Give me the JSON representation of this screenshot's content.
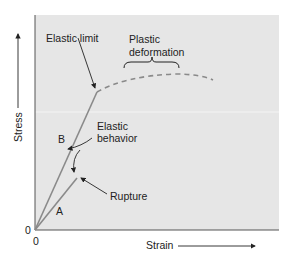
{
  "diagram": {
    "axes": {
      "y_label": "Stress",
      "x_label": "Strain",
      "y_origin_label": "0",
      "x_origin_label": "0"
    },
    "annotations": {
      "elastic_limit": "Elastic limit",
      "plastic_line1": "Plastic",
      "plastic_line2": "deformation",
      "elastic_line1": "Elastic",
      "elastic_line2": "behavior",
      "rupture": "Rupture",
      "curve_a": "A",
      "curve_b": "B"
    },
    "colors": {
      "plot_background": "#e6e6e6",
      "curve": "#8a8a8a",
      "axis": "#555555",
      "text": "#222222"
    }
  }
}
